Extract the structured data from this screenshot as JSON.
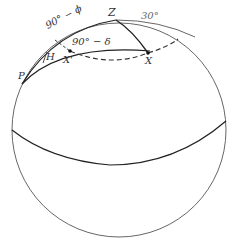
{
  "diagram": {
    "type": "celestial-sphere-navigational-triangle",
    "labels": {
      "zenith": "Z",
      "pole": "P",
      "hour_angle": "H",
      "star_x": "X",
      "star_x_prime": "X'",
      "colatitude": "90° − ϕ",
      "codeclination": "90° − δ",
      "angle": "30°"
    },
    "colors": {
      "line": "#333333",
      "background": "#ffffff"
    }
  }
}
